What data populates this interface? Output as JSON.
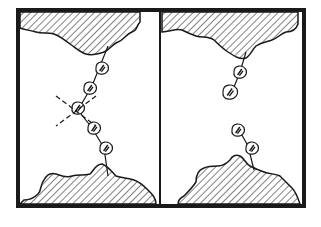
{
  "figure": {
    "colors": {
      "ink": "#1a1a1a",
      "paper": "#ffffff"
    },
    "frame": {
      "x": 18,
      "y": 10,
      "width": 286,
      "height": 196,
      "divider_x": 160
    },
    "panels": [
      {
        "name": "intact-chain",
        "top_surface": "M20,12 L140,12 L140,22 C136,26 138,30 132,32 C126,34 124,40 118,42 C112,44 110,50 104,52 C98,54 92,56 86,54 C80,52 76,48 70,44 C64,40 60,36 54,34 C48,32 42,34 36,32 C30,30 24,30 20,28 Z",
        "bottom_surface": "M20,204 L156,204 C156,198 152,194 148,190 C144,186 140,182 134,180 C128,178 122,178 116,176 C112,172 108,166 102,164 C96,164 94,170 90,174 C84,176 78,174 72,176 C66,178 62,176 56,174 C50,172 46,176 44,180 C40,184 42,190 38,194 C34,198 28,200 24,200 Z",
        "chain_line": [
          [
            108,
            46
          ],
          [
            100,
            66
          ],
          [
            92,
            86
          ],
          [
            78,
            110
          ],
          [
            92,
            128
          ],
          [
            104,
            148
          ],
          [
            108,
            176
          ]
        ],
        "particles": [
          {
            "cx": 102,
            "cy": 68,
            "r": 6
          },
          {
            "cx": 90,
            "cy": 88,
            "r": 6
          },
          {
            "cx": 78,
            "cy": 108,
            "r": 6
          },
          {
            "cx": 94,
            "cy": 128,
            "r": 6
          },
          {
            "cx": 106,
            "cy": 148,
            "r": 6
          }
        ],
        "cut_mark": {
          "cx": 76,
          "cy": 110,
          "lines": [
            [
              [
                56,
                96
              ],
              [
                96,
                126
              ]
            ],
            [
              [
                96,
                96
              ],
              [
                56,
                126
              ]
            ]
          ]
        }
      },
      {
        "name": "broken-chain",
        "top_surface": "M162,12 L298,12 L298,24 C296,30 292,32 286,32 C280,34 278,38 272,40 C266,42 262,42 256,46 C252,50 250,56 246,58 C240,60 234,56 228,52 C222,48 218,44 214,40 C208,36 202,38 196,36 C190,34 186,32 182,30 C176,28 170,32 162,32 Z",
        "bottom_surface": "M178,204 L300,204 C298,198 296,192 292,188 C288,184 284,180 280,176 C276,174 270,174 264,172 C258,170 254,168 250,166 C246,164 244,158 240,156 C236,154 232,156 230,160 C226,164 222,166 218,166 C212,166 208,166 204,168 C198,170 196,176 196,182 C192,188 188,192 184,196 C180,198 178,200 178,204 Z",
        "upper_fragment": {
          "line": [
            [
              246,
              52
            ],
            [
              240,
              72
            ],
            [
              232,
              92
            ]
          ],
          "particles": [
            {
              "cx": 240,
              "cy": 72,
              "r": 6
            },
            {
              "cx": 230,
              "cy": 92,
              "r": 7
            }
          ]
        },
        "lower_fragment": {
          "line": [
            [
              238,
              128
            ],
            [
              248,
              146
            ],
            [
              254,
              170
            ]
          ],
          "particles": [
            {
              "cx": 238,
              "cy": 130,
              "r": 6
            },
            {
              "cx": 252,
              "cy": 148,
              "r": 6
            }
          ]
        }
      }
    ]
  }
}
